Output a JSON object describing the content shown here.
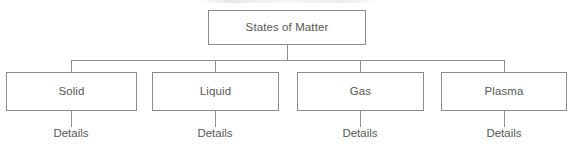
{
  "diagram": {
    "type": "hierarchy-tree",
    "orientation": "top-down",
    "levels": 3,
    "colors": {
      "background": "#ffffff",
      "box_border": "#8c8c8c",
      "connector": "#8f8f8f",
      "text": "#585858"
    },
    "root": {
      "label": "States of Matter"
    },
    "children": [
      {
        "label": "Solid",
        "leaf_label": "Details"
      },
      {
        "label": "Liquid",
        "leaf_label": "Details"
      },
      {
        "label": "Gas",
        "leaf_label": "Details"
      },
      {
        "label": "Plasma",
        "leaf_label": "Details"
      }
    ]
  }
}
